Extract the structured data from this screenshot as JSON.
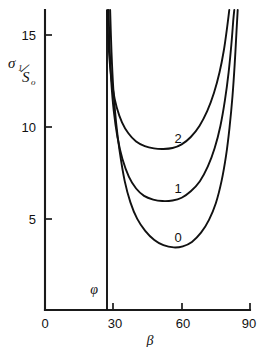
{
  "chart_data": {
    "type": "line",
    "title": "",
    "xlabel": "β",
    "ylabel": "σ₁/S₀",
    "xlim": [
      0,
      90
    ],
    "ylim": [
      0,
      16.3
    ],
    "grid": false,
    "legend": "inline-curve-labels",
    "xticks": [
      0,
      30,
      60,
      90
    ],
    "xtick_labels": [
      "0",
      "30",
      "60",
      "90"
    ],
    "yticks": [
      5,
      10,
      15
    ],
    "ytick_labels": [
      "5",
      "10",
      "15"
    ],
    "annotations": [
      {
        "text": "φ",
        "x": 24.5,
        "y": 1.6,
        "note": "friction angle asymptote marker"
      }
    ],
    "asymptote": {
      "label": "φ",
      "x": 27.0,
      "y_from": 0,
      "y_to": 16.3
    },
    "series": [
      {
        "name": "0",
        "label": "0",
        "label_x": 57.5,
        "label_y": 4.25,
        "points": [
          {
            "x": 28.6,
            "y": 16.3
          },
          {
            "x": 29.2,
            "y": 14.0
          },
          {
            "x": 30.0,
            "y": 12.0
          },
          {
            "x": 31.2,
            "y": 10.2
          },
          {
            "x": 32.8,
            "y": 8.6
          },
          {
            "x": 35.0,
            "y": 7.0
          },
          {
            "x": 37.5,
            "y": 5.85
          },
          {
            "x": 40.5,
            "y": 4.95
          },
          {
            "x": 44.0,
            "y": 4.3
          },
          {
            "x": 48.0,
            "y": 3.8
          },
          {
            "x": 52.0,
            "y": 3.52
          },
          {
            "x": 56.5,
            "y": 3.4
          },
          {
            "x": 60.5,
            "y": 3.46
          },
          {
            "x": 64.5,
            "y": 3.7
          },
          {
            "x": 68.5,
            "y": 4.2
          },
          {
            "x": 72.0,
            "y": 4.9
          },
          {
            "x": 75.0,
            "y": 5.8
          },
          {
            "x": 77.5,
            "y": 7.0
          },
          {
            "x": 79.5,
            "y": 8.4
          },
          {
            "x": 81.0,
            "y": 9.9
          },
          {
            "x": 82.3,
            "y": 11.6
          },
          {
            "x": 83.3,
            "y": 13.4
          },
          {
            "x": 84.1,
            "y": 15.2
          },
          {
            "x": 84.6,
            "y": 16.3
          }
        ]
      },
      {
        "name": "1",
        "label": "1",
        "label_x": 57.5,
        "label_y": 6.85,
        "points": [
          {
            "x": 27.9,
            "y": 16.3
          },
          {
            "x": 28.4,
            "y": 14.2
          },
          {
            "x": 29.1,
            "y": 12.4
          },
          {
            "x": 30.2,
            "y": 10.8
          },
          {
            "x": 31.8,
            "y": 9.4
          },
          {
            "x": 34.0,
            "y": 8.2
          },
          {
            "x": 36.8,
            "y": 7.25
          },
          {
            "x": 40.0,
            "y": 6.6
          },
          {
            "x": 43.5,
            "y": 6.2
          },
          {
            "x": 47.5,
            "y": 6.0
          },
          {
            "x": 51.5,
            "y": 5.92
          },
          {
            "x": 56.0,
            "y": 5.95
          },
          {
            "x": 60.0,
            "y": 6.1
          },
          {
            "x": 64.0,
            "y": 6.45
          },
          {
            "x": 68.0,
            "y": 7.0
          },
          {
            "x": 71.5,
            "y": 7.8
          },
          {
            "x": 74.5,
            "y": 8.8
          },
          {
            "x": 77.0,
            "y": 10.0
          },
          {
            "x": 79.0,
            "y": 11.4
          },
          {
            "x": 80.6,
            "y": 12.9
          },
          {
            "x": 81.8,
            "y": 14.4
          },
          {
            "x": 82.7,
            "y": 15.8
          },
          {
            "x": 83.1,
            "y": 16.3
          }
        ]
      },
      {
        "name": "2",
        "label": "2",
        "label_x": 57.5,
        "label_y": 9.55,
        "points": [
          {
            "x": 27.3,
            "y": 16.3
          },
          {
            "x": 27.8,
            "y": 14.6
          },
          {
            "x": 28.6,
            "y": 13.2
          },
          {
            "x": 29.8,
            "y": 12.0
          },
          {
            "x": 31.5,
            "y": 11.0
          },
          {
            "x": 33.8,
            "y": 10.2
          },
          {
            "x": 36.6,
            "y": 9.6
          },
          {
            "x": 40.0,
            "y": 9.15
          },
          {
            "x": 43.8,
            "y": 8.9
          },
          {
            "x": 47.8,
            "y": 8.78
          },
          {
            "x": 52.0,
            "y": 8.75
          },
          {
            "x": 56.0,
            "y": 8.8
          },
          {
            "x": 60.0,
            "y": 9.0
          },
          {
            "x": 64.0,
            "y": 9.4
          },
          {
            "x": 67.8,
            "y": 10.0
          },
          {
            "x": 71.2,
            "y": 10.8
          },
          {
            "x": 74.2,
            "y": 11.8
          },
          {
            "x": 76.6,
            "y": 12.9
          },
          {
            "x": 78.5,
            "y": 14.1
          },
          {
            "x": 80.0,
            "y": 15.4
          },
          {
            "x": 80.9,
            "y": 16.3
          }
        ]
      }
    ]
  },
  "axes": {
    "y_axis_label_sigma": "σ",
    "y_axis_label_sigma_sub": "1",
    "y_axis_label_slash": "/",
    "y_axis_label_s": "S",
    "y_axis_label_s_sub": "o",
    "x_axis_label": "β"
  },
  "labels": {
    "phi": "φ",
    "curve_0": "0",
    "curve_1": "1",
    "curve_2": "2",
    "y_tick_5": "5",
    "y_tick_10": "10",
    "y_tick_15": "15",
    "x_tick_0": "0",
    "x_tick_30": "30",
    "x_tick_60": "60",
    "x_tick_90": "90"
  },
  "colors": {
    "background": "#ffffff",
    "ink": "#111111",
    "axis": "#1a1a1a"
  }
}
